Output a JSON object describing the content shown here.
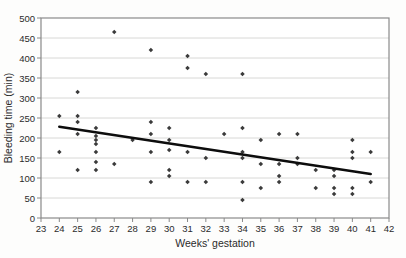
{
  "figure": {
    "background": "#fdfdfc",
    "plot_background": "#ffffff",
    "frame_color": "#8a8a8a",
    "gridline_color": "#d8d8d6",
    "tick_color": "#8a8a8a",
    "point_color": "#3b3b3b",
    "trendline_color": "#0d0d0d",
    "text_color": "#2b2b2b"
  },
  "chart_data": {
    "type": "scatter",
    "title": "",
    "xlabel": "Weeks' gestation",
    "ylabel": "Bleeding time (min)",
    "xlim": [
      23,
      42
    ],
    "ylim": [
      0,
      500
    ],
    "x_ticks": [
      23,
      24,
      25,
      26,
      27,
      28,
      29,
      30,
      31,
      32,
      33,
      34,
      35,
      36,
      37,
      38,
      39,
      40,
      41,
      42
    ],
    "y_ticks": [
      0,
      50,
      100,
      150,
      200,
      250,
      300,
      350,
      400,
      450,
      500
    ],
    "grid": "horizontal",
    "legend": "none",
    "points": [
      [
        24,
        255
      ],
      [
        24,
        165
      ],
      [
        25,
        315
      ],
      [
        25,
        255
      ],
      [
        25,
        240
      ],
      [
        25,
        210
      ],
      [
        25,
        120
      ],
      [
        26,
        225
      ],
      [
        26,
        205
      ],
      [
        26,
        195
      ],
      [
        26,
        185
      ],
      [
        26,
        165
      ],
      [
        26,
        140
      ],
      [
        26,
        120
      ],
      [
        27,
        465
      ],
      [
        27,
        135
      ],
      [
        28,
        195
      ],
      [
        29,
        420
      ],
      [
        29,
        240
      ],
      [
        29,
        210
      ],
      [
        29,
        165
      ],
      [
        29,
        90
      ],
      [
        30,
        225
      ],
      [
        30,
        195
      ],
      [
        30,
        170
      ],
      [
        30,
        120
      ],
      [
        30,
        105
      ],
      [
        31,
        405
      ],
      [
        31,
        375
      ],
      [
        31,
        165
      ],
      [
        31,
        90
      ],
      [
        32,
        360
      ],
      [
        32,
        150
      ],
      [
        32,
        90
      ],
      [
        33,
        210
      ],
      [
        34,
        360
      ],
      [
        34,
        225
      ],
      [
        34,
        165
      ],
      [
        34,
        150
      ],
      [
        34,
        90
      ],
      [
        34,
        45
      ],
      [
        35,
        195
      ],
      [
        35,
        135
      ],
      [
        35,
        75
      ],
      [
        36,
        210
      ],
      [
        36,
        135
      ],
      [
        36,
        105
      ],
      [
        36,
        90
      ],
      [
        37,
        210
      ],
      [
        37,
        150
      ],
      [
        37,
        135
      ],
      [
        38,
        120
      ],
      [
        38,
        75
      ],
      [
        39,
        120
      ],
      [
        39,
        105
      ],
      [
        39,
        75
      ],
      [
        39,
        60
      ],
      [
        40,
        195
      ],
      [
        40,
        165
      ],
      [
        40,
        150
      ],
      [
        40,
        75
      ],
      [
        40,
        60
      ],
      [
        41,
        165
      ],
      [
        41,
        90
      ]
    ],
    "trendline": {
      "x1": 24,
      "y1": 228,
      "x2": 41,
      "y2": 110
    }
  }
}
